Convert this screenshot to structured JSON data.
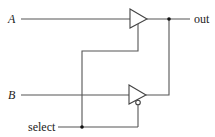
{
  "diagram": {
    "type": "circuit",
    "labels": {
      "input_a": "A",
      "input_b": "B",
      "select": "select",
      "output": "out"
    },
    "components": [
      {
        "id": "buffer-top",
        "kind": "tri-state buffer",
        "input": "A",
        "enable": "select (active high)"
      },
      {
        "id": "buffer-bottom",
        "kind": "tri-state buffer",
        "input": "B",
        "enable": "select (active low, inverted bubble)"
      }
    ],
    "colors": {
      "wire": "#555555",
      "gate_stroke": "#444444",
      "junction": "#111111",
      "background": "#ffffff"
    }
  }
}
